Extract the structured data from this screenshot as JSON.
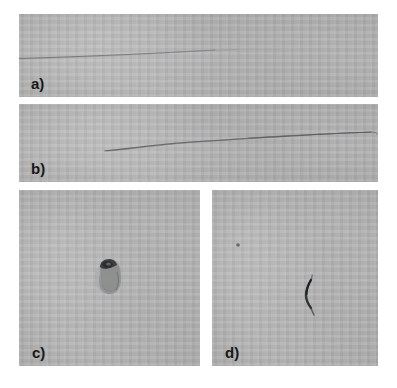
{
  "figure": {
    "type": "micrograph-panel-figure",
    "background_color": "#ffffff",
    "panel_background_color": "#b8b8b8",
    "label_color": "#16181a",
    "panels": [
      {
        "id": "a",
        "label": "a)",
        "content": "long thin dark fiber running nearly horizontally across the left two-thirds of the frame",
        "specimen": "fiber"
      },
      {
        "id": "b",
        "label": "b)",
        "content": "long dark fiber with a gentle upward curve spanning the middle of the frame",
        "specimen": "fiber"
      },
      {
        "id": "c",
        "label": "c)",
        "content": "single dark irregular fragment particle near the centre of the frame",
        "specimen": "fragment"
      },
      {
        "id": "d",
        "label": "d)",
        "content": "short dark hook-shaped fiber near the centre of the frame with a small speck upper left",
        "specimen": "fiber"
      }
    ]
  }
}
